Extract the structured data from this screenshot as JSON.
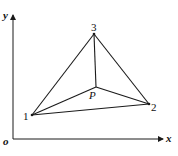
{
  "diagram": {
    "type": "geometry",
    "axes": {
      "origin_label": "o",
      "x_label": "x",
      "y_label": "y"
    },
    "points": [
      {
        "id": "1",
        "label": "1",
        "x": 32,
        "y": 115
      },
      {
        "id": "2",
        "label": "2",
        "x": 149,
        "y": 104
      },
      {
        "id": "3",
        "label": "3",
        "x": 94,
        "y": 34
      },
      {
        "id": "P",
        "label": "P",
        "x": 96,
        "y": 87
      }
    ],
    "edges": [
      [
        "1",
        "2"
      ],
      [
        "2",
        "3"
      ],
      [
        "3",
        "1"
      ],
      [
        "P",
        "1"
      ],
      [
        "P",
        "2"
      ],
      [
        "P",
        "3"
      ]
    ],
    "colors": {
      "line": "#1a1a1a",
      "background": "#ffffff"
    }
  }
}
